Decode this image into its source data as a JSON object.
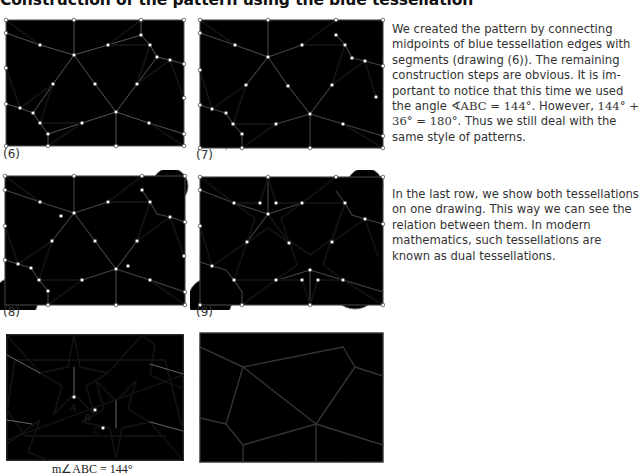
{
  "header": {
    "title": "Construction of the pattern using the blue tessellation"
  },
  "figures": [
    {
      "id": "6",
      "label": "(6)"
    },
    {
      "id": "7",
      "label": "(7)"
    },
    {
      "id": "8",
      "label": "(8)"
    },
    {
      "id": "9",
      "label": "(9)"
    },
    {
      "id": "star-pattern",
      "label": "",
      "points": {
        "A": "A",
        "B": "B",
        "C": "C"
      },
      "caption": "m∠ABC = 144°"
    },
    {
      "id": "dual-tessellation",
      "label": ""
    }
  ],
  "paragraphs": [
    {
      "pre": "We created the pattern by connecting midpoints of blue tessellation edges with segments (drawing (6)). The remaining construction steps are obvious. It is im­portant to notice that this time we used the angle ",
      "math1": "∢ABC = 144°",
      "mid": ". However, ",
      "math2": "144° + 36° = 180°",
      "post": ". Thus we still deal with the same style of patterns."
    },
    {
      "text": "In the last row, we show both tessella­tions on one drawing. This way we can see the relation between them. In mod­ern mathematics, such tessellations are known as dual tessellations."
    }
  ],
  "colors": {
    "thin_line": "#555555",
    "thick_line": "#111111",
    "gray_line": "#8a8a8a",
    "text": "#333333"
  }
}
